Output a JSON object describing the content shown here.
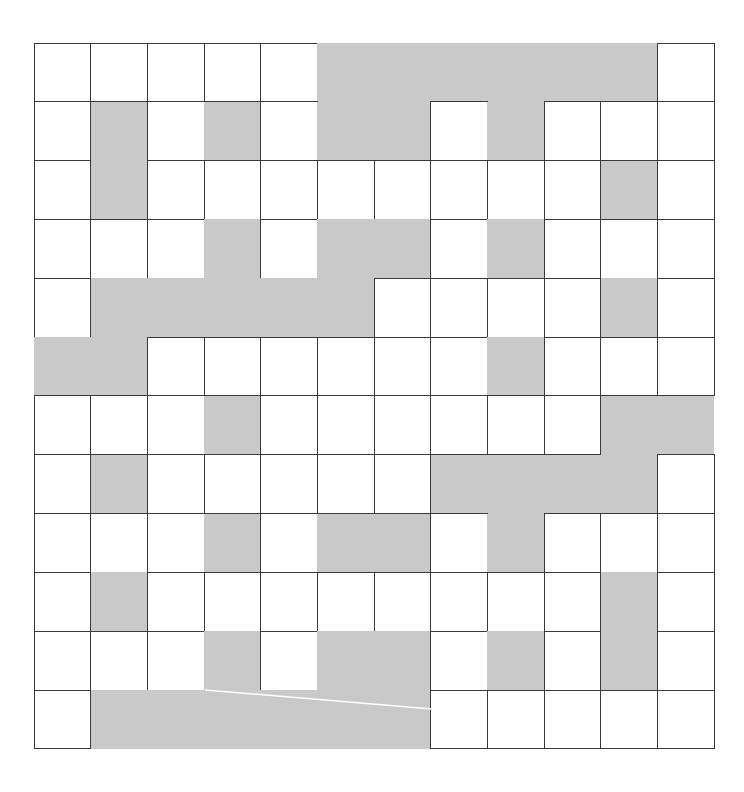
{
  "puzzle": {
    "type": "crossword-grid",
    "rows": 12,
    "cols": 12,
    "colors": {
      "open": "#ffffff",
      "blocked": "#c9c9c9",
      "line": "#3a3a3a"
    },
    "legend": "0 = open (white) cell, 1 = blocked (gray) cell",
    "grid": [
      [
        0,
        0,
        0,
        0,
        0,
        1,
        1,
        1,
        1,
        1,
        1,
        0
      ],
      [
        0,
        1,
        0,
        1,
        0,
        1,
        1,
        0,
        1,
        0,
        0,
        0
      ],
      [
        0,
        1,
        0,
        0,
        0,
        0,
        0,
        0,
        0,
        0,
        1,
        0
      ],
      [
        0,
        0,
        0,
        1,
        0,
        1,
        1,
        0,
        1,
        0,
        0,
        0
      ],
      [
        0,
        1,
        1,
        1,
        1,
        1,
        0,
        0,
        0,
        0,
        1,
        0
      ],
      [
        1,
        1,
        0,
        0,
        0,
        0,
        0,
        0,
        1,
        0,
        0,
        0
      ],
      [
        0,
        0,
        0,
        1,
        0,
        0,
        0,
        0,
        0,
        0,
        1,
        1
      ],
      [
        0,
        1,
        0,
        0,
        0,
        0,
        0,
        1,
        1,
        1,
        1,
        0
      ],
      [
        0,
        0,
        0,
        1,
        0,
        1,
        1,
        0,
        1,
        0,
        0,
        0
      ],
      [
        0,
        1,
        0,
        0,
        0,
        0,
        0,
        0,
        0,
        0,
        1,
        0
      ],
      [
        0,
        0,
        0,
        1,
        0,
        1,
        1,
        0,
        1,
        0,
        1,
        0
      ],
      [
        0,
        1,
        1,
        1,
        1,
        1,
        1,
        0,
        0,
        0,
        0,
        0
      ]
    ],
    "annotation_line": {
      "x1": 205,
      "y1": 690,
      "x2": 432,
      "y2": 709,
      "color": "#ffffff"
    }
  }
}
